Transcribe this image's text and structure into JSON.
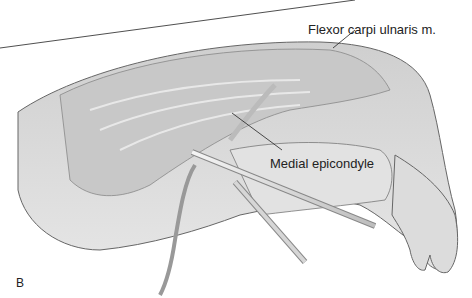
{
  "figure": {
    "panel_letter": "B",
    "labels": [
      {
        "text": "Flexor carpi ulnaris m.",
        "x": 308,
        "y": 22
      },
      {
        "text": "Medial epicondyle",
        "x": 270,
        "y": 156
      }
    ],
    "colors": {
      "skin": "#d9d9d9",
      "muscle": "#c4c4c4",
      "outline": "#555555",
      "instrument": "#bdbdbd",
      "text": "#222222"
    }
  }
}
